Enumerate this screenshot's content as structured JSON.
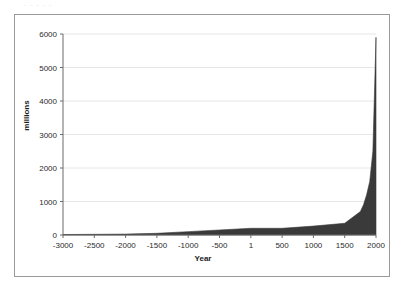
{
  "scan": {
    "top_cutoff_text": "- -  -   -    -"
  },
  "chart_data": {
    "type": "area",
    "title": "",
    "xlabel": "Year",
    "ylabel": "millions",
    "xlim": [
      -3000,
      2000
    ],
    "ylim": [
      0,
      6000
    ],
    "grid": true,
    "legend": "none",
    "series_color": "#3a3a3a",
    "plot_background": "#ffffff",
    "gridline_color": "#e6e6e6",
    "axis_color": "#6b6b6b",
    "frame_color": "#9a9a9a",
    "x_tick_labels": [
      "-3000",
      "-2500",
      "-2000",
      "-1500",
      "-1000",
      "-500",
      "1",
      "500",
      "1000",
      "1500",
      "2000"
    ],
    "x_tick_values": [
      -3000,
      -2500,
      -2000,
      -1500,
      -1000,
      -500,
      1,
      500,
      1000,
      1500,
      2000
    ],
    "y_tick_labels": [
      "0",
      "1000",
      "2000",
      "3000",
      "4000",
      "5000",
      "6000"
    ],
    "y_tick_values": [
      0,
      1000,
      2000,
      3000,
      4000,
      5000,
      6000
    ],
    "x": [
      -3000,
      -2500,
      -2000,
      -1500,
      -1000,
      -500,
      1,
      500,
      1000,
      1500,
      1750,
      1800,
      1850,
      1900,
      1950,
      2000
    ],
    "values": [
      14,
      20,
      27,
      50,
      100,
      150,
      200,
      200,
      265,
      350,
      700,
      900,
      1200,
      1600,
      2500,
      5900
    ],
    "series": [
      {
        "name": "world population",
        "values": [
          14,
          20,
          27,
          50,
          100,
          150,
          200,
          200,
          265,
          350,
          700,
          900,
          1200,
          1600,
          2500,
          5900
        ]
      }
    ],
    "peak_value": 5900,
    "peak_year": 2000
  }
}
